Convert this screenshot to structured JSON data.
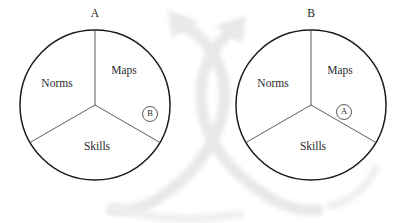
{
  "figure": {
    "background_color": "#ffffff",
    "outline_color": "#1a1a1a",
    "spoke_color": "#4a4a4a",
    "watermark_color": "#ececed",
    "diagrams": [
      {
        "id": "diagram-a",
        "top_label": "A",
        "center": {
          "x": 95,
          "y": 105
        },
        "radius": 75,
        "sectors": [
          {
            "name": "maps",
            "label": "Maps",
            "label_x": 124,
            "label_y": 71
          },
          {
            "name": "norms",
            "label": "Norms",
            "label_x": 57,
            "label_y": 84
          },
          {
            "name": "skills",
            "label": "Skills",
            "label_x": 97,
            "label_y": 147
          }
        ],
        "marker": {
          "label": "B",
          "x": 150,
          "y": 114,
          "r": 7.5
        }
      },
      {
        "id": "diagram-b",
        "top_label": "B",
        "center": {
          "x": 311,
          "y": 105
        },
        "radius": 75,
        "sectors": [
          {
            "name": "maps",
            "label": "Maps",
            "label_x": 340,
            "label_y": 71
          },
          {
            "name": "norms",
            "label": "Norms",
            "label_x": 273,
            "label_y": 84
          },
          {
            "name": "skills",
            "label": "Skills",
            "label_x": 313,
            "label_y": 147
          }
        ],
        "marker": {
          "label": "A",
          "x": 344,
          "y": 112,
          "r": 7.5
        }
      }
    ]
  }
}
